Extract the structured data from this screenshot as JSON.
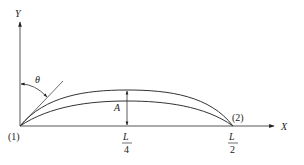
{
  "diagram": {
    "axes": {
      "x_label": "X",
      "y_label": "Y"
    },
    "points": {
      "start_label": "(1)",
      "end_label": "(2)"
    },
    "angle_label": "θ",
    "amplitude_label": "A",
    "ticks": {
      "quarter": {
        "numerator": "L",
        "denominator": "4"
      },
      "half": {
        "numerator": "L",
        "denominator": "2"
      }
    },
    "colors": {
      "line": "#333333",
      "text": "#222222",
      "background": "#ffffff"
    }
  }
}
